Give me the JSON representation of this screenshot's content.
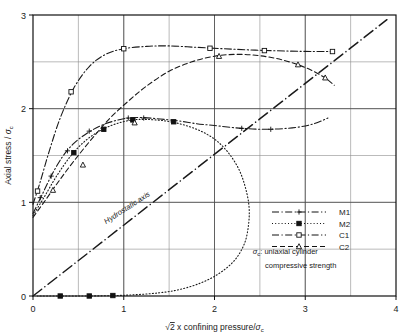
{
  "chart_data": {
    "type": "line",
    "title": "",
    "xlabel": "√2 x confining pressure/σc",
    "xlabel_parts": {
      "radical": "√",
      "radicand": "2",
      "mid": " x confining pressure/",
      "sym": "σ",
      "sub": "c"
    },
    "ylabel": "Axial stress / σc",
    "ylabel_parts": {
      "main": "Axial stress /",
      "sym": "σ",
      "sub": "c"
    },
    "xlim": [
      0,
      4
    ],
    "ylim": [
      0,
      3
    ],
    "xticks": [
      "0",
      "1",
      "2",
      "3",
      "4"
    ],
    "xtick_values": [
      0,
      1,
      2,
      3,
      4
    ],
    "yticks": [
      "0",
      "1",
      "2",
      "3"
    ],
    "ytick_values": [
      0,
      1,
      2,
      3
    ],
    "grid": true,
    "grid_x_values": [
      0.5,
      1,
      1.5,
      2,
      2.5,
      3,
      3.5
    ],
    "grid_y_values": [
      0.5,
      1,
      1.5,
      2,
      2.5
    ],
    "legend_position": "right-lower",
    "annotations": [
      {
        "name": "hydrostatic-axis-label",
        "text": "Hydrostatic axis",
        "x": 1.05,
        "y": 0.92,
        "rotation": -33
      },
      {
        "name": "sigma-note-line1",
        "text": ": uniaxial cylinder",
        "symbol": "σ",
        "subscript": "c",
        "x": 2.78,
        "y": 0.45
      },
      {
        "name": "sigma-note-line2",
        "text": "compressive strength",
        "x": 2.95,
        "y": 0.3
      }
    ],
    "series": [
      {
        "name": "M1",
        "label": "M1",
        "style": "dash-dot",
        "marker": "plus",
        "color": "#1a1a1a",
        "points": [
          [
            0.0,
            0.88
          ],
          [
            0.1,
            1.08
          ],
          [
            0.2,
            1.28
          ],
          [
            0.32,
            1.48
          ],
          [
            0.45,
            1.63
          ],
          [
            0.6,
            1.74
          ],
          [
            0.75,
            1.82
          ],
          [
            0.9,
            1.87
          ],
          [
            1.05,
            1.9
          ],
          [
            1.2,
            1.905
          ],
          [
            1.4,
            1.89
          ],
          [
            1.6,
            1.87
          ],
          [
            1.8,
            1.84
          ],
          [
            2.0,
            1.82
          ],
          [
            2.3,
            1.79
          ],
          [
            2.6,
            1.78
          ],
          [
            2.9,
            1.8
          ],
          [
            3.1,
            1.84
          ],
          [
            3.25,
            1.9
          ]
        ],
        "markers": [
          [
            0.08,
            1.05
          ],
          [
            0.2,
            1.28
          ],
          [
            0.38,
            1.55
          ],
          [
            0.62,
            1.76
          ],
          [
            1.05,
            1.9
          ],
          [
            1.22,
            1.9
          ],
          [
            2.3,
            1.79
          ],
          [
            2.62,
            1.78
          ]
        ]
      },
      {
        "name": "M2",
        "label": "M2",
        "style": "dotted",
        "marker": "square-filled",
        "color": "#1a1a1a",
        "points": [
          [
            0.0,
            0.86
          ],
          [
            0.12,
            1.05
          ],
          [
            0.26,
            1.28
          ],
          [
            0.42,
            1.5
          ],
          [
            0.58,
            1.66
          ],
          [
            0.75,
            1.77
          ],
          [
            0.92,
            1.84
          ],
          [
            1.1,
            1.88
          ],
          [
            1.25,
            1.885
          ],
          [
            1.45,
            1.87
          ],
          [
            1.65,
            1.83
          ],
          [
            1.85,
            1.76
          ],
          [
            2.02,
            1.66
          ],
          [
            2.16,
            1.52
          ],
          [
            2.27,
            1.35
          ],
          [
            2.34,
            1.16
          ],
          [
            2.38,
            0.96
          ],
          [
            2.375,
            0.76
          ],
          [
            2.33,
            0.56
          ],
          [
            2.22,
            0.38
          ],
          [
            2.05,
            0.24
          ],
          [
            1.85,
            0.14
          ],
          [
            1.62,
            0.07
          ],
          [
            1.4,
            0.035
          ],
          [
            1.15,
            0.015
          ],
          [
            0.9,
            0.005
          ],
          [
            0.6,
            0.0
          ],
          [
            0.3,
            0.0
          ],
          [
            0.05,
            0.0
          ]
        ],
        "markers": [
          [
            0.45,
            1.53
          ],
          [
            0.78,
            1.78
          ],
          [
            1.1,
            1.88
          ],
          [
            1.55,
            1.86
          ],
          [
            0.3,
            0.0
          ],
          [
            0.62,
            0.0
          ],
          [
            0.88,
            0.005
          ]
        ]
      },
      {
        "name": "C1",
        "label": "C1",
        "style": "dash-dot",
        "marker": "square-open",
        "color": "#1a1a1a",
        "points": [
          [
            0.0,
            0.98
          ],
          [
            0.08,
            1.22
          ],
          [
            0.18,
            1.55
          ],
          [
            0.3,
            1.9
          ],
          [
            0.45,
            2.22
          ],
          [
            0.62,
            2.45
          ],
          [
            0.8,
            2.58
          ],
          [
            1.0,
            2.64
          ],
          [
            1.25,
            2.665
          ],
          [
            1.5,
            2.67
          ],
          [
            1.8,
            2.655
          ],
          [
            2.1,
            2.64
          ],
          [
            2.45,
            2.625
          ],
          [
            2.8,
            2.615
          ],
          [
            3.1,
            2.61
          ],
          [
            3.32,
            2.61
          ]
        ],
        "markers": [
          [
            0.05,
            1.12
          ],
          [
            0.42,
            2.18
          ],
          [
            1.0,
            2.64
          ],
          [
            1.95,
            2.645
          ],
          [
            2.55,
            2.62
          ],
          [
            3.3,
            2.61
          ]
        ]
      },
      {
        "name": "C2",
        "label": "C2",
        "style": "dashed",
        "marker": "triangle-open",
        "color": "#1a1a1a",
        "points": [
          [
            0.0,
            0.84
          ],
          [
            0.12,
            1.0
          ],
          [
            0.28,
            1.22
          ],
          [
            0.45,
            1.44
          ],
          [
            0.65,
            1.68
          ],
          [
            0.85,
            1.9
          ],
          [
            1.05,
            2.08
          ],
          [
            1.25,
            2.24
          ],
          [
            1.5,
            2.4
          ],
          [
            1.75,
            2.5
          ],
          [
            2.0,
            2.56
          ],
          [
            2.25,
            2.58
          ],
          [
            2.5,
            2.565
          ],
          [
            2.75,
            2.52
          ],
          [
            3.0,
            2.44
          ],
          [
            3.2,
            2.34
          ],
          [
            3.32,
            2.25
          ]
        ],
        "markers": [
          [
            0.22,
            1.13
          ],
          [
            0.55,
            1.4
          ],
          [
            1.12,
            1.85
          ],
          [
            2.05,
            2.56
          ],
          [
            2.92,
            2.47
          ],
          [
            3.22,
            2.33
          ]
        ]
      },
      {
        "name": "hydrostatic-axis",
        "label": "Hydrostatic axis",
        "style": "long-dash",
        "marker": "none",
        "color": "#1a1a1a",
        "points": [
          [
            0.0,
            0.0
          ],
          [
            3.9,
            2.95
          ]
        ],
        "markers": []
      }
    ]
  },
  "legend": {
    "entries": [
      {
        "label": "M1",
        "style": "dash-dot",
        "marker": "plus"
      },
      {
        "label": "M2",
        "style": "dotted",
        "marker": "square-filled"
      },
      {
        "label": "C1",
        "style": "dash-dot",
        "marker": "square-open"
      },
      {
        "label": "C2",
        "style": "dashed",
        "marker": "triangle-open"
      }
    ]
  },
  "note": {
    "symbol": "σ",
    "subscript": "c",
    "line1": ": uniaxial cylinder",
    "line2": "compressive strength"
  }
}
